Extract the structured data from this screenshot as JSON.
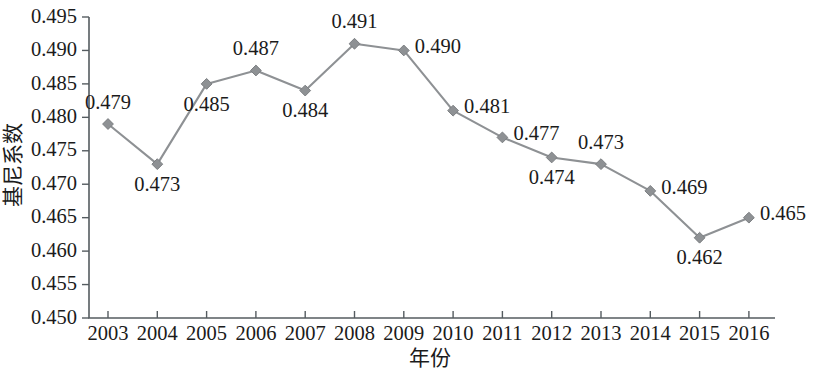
{
  "chart_data": {
    "type": "line",
    "title": "",
    "xlabel": "年份",
    "ylabel": "基尼系数",
    "categories": [
      "2003",
      "2004",
      "2005",
      "2006",
      "2007",
      "2008",
      "2009",
      "2010",
      "2011",
      "2012",
      "2013",
      "2014",
      "2015",
      "2016"
    ],
    "values": [
      0.479,
      0.473,
      0.485,
      0.487,
      0.484,
      0.491,
      0.49,
      0.481,
      0.477,
      0.474,
      0.473,
      0.469,
      0.462,
      0.465
    ],
    "data_labels": [
      "0.479",
      "0.473",
      "0.485",
      "0.487",
      "0.484",
      "0.491",
      "0.490",
      "0.481",
      "0.477",
      "0.474",
      "0.473",
      "0.469",
      "0.462",
      "0.465"
    ],
    "label_positions": [
      "above",
      "below",
      "below",
      "above",
      "below",
      "above",
      "right",
      "right",
      "right",
      "below",
      "above",
      "right",
      "below",
      "right"
    ],
    "ylim": [
      0.45,
      0.495
    ],
    "ytick_labels": [
      "0.450",
      "0.455",
      "0.460",
      "0.465",
      "0.470",
      "0.475",
      "0.480",
      "0.485",
      "0.490",
      "0.495"
    ],
    "ytick_values": [
      0.45,
      0.455,
      0.46,
      0.465,
      0.47,
      0.475,
      0.48,
      0.485,
      0.49,
      0.495
    ],
    "grid": false,
    "legend": "none",
    "series_color": "#8e9194",
    "axis_color": "#555c60",
    "text_color": "#1b1b1b",
    "marker": "diamond"
  }
}
